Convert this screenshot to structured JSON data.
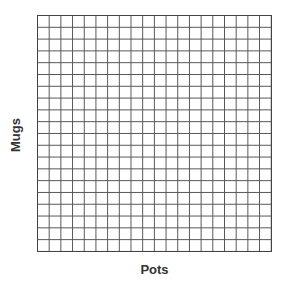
{
  "chart_data": {
    "type": "scatter",
    "title": "",
    "xlabel": "Pots",
    "ylabel": "Mugs",
    "grid": true,
    "grid_columns": 20,
    "grid_rows": 20,
    "x": [],
    "y": [],
    "series": [],
    "legend": null
  },
  "colors": {
    "grid_line": "#555555",
    "background": "#ffffff",
    "label_text": "#333333"
  }
}
